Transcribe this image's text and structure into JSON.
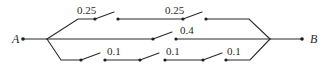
{
  "diagram": {
    "type": "switch-network",
    "terminals": {
      "left": {
        "label": "A"
      },
      "right": {
        "label": "B"
      }
    },
    "branches": [
      {
        "name": "top",
        "switches": [
          {
            "label": "0.25"
          },
          {
            "label": "0.25"
          }
        ]
      },
      {
        "name": "middle",
        "switches": [
          {
            "label": "0.4"
          }
        ]
      },
      {
        "name": "bottom",
        "switches": [
          {
            "label": "0.1"
          },
          {
            "label": "0.1"
          },
          {
            "label": "0.1"
          }
        ]
      }
    ],
    "colors": {
      "line": "#2a2a2a",
      "background": "#ffffff"
    }
  }
}
